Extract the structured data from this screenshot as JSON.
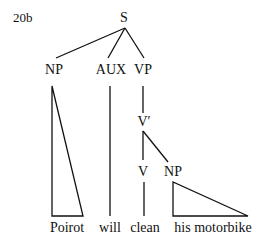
{
  "example_number": "20b",
  "tree": {
    "root": "S",
    "nodes": {
      "s": "S",
      "np_subject": "NP",
      "aux": "AUX",
      "vp": "VP",
      "v_bar": "V′",
      "v": "V",
      "np_object": "NP"
    },
    "leaves": {
      "subject": "Poirot",
      "aux": "will",
      "verb": "clean",
      "object": "his motorbike"
    },
    "structure": "[S [NP Poirot] [AUX will] [VP [V' [V clean] [NP his motorbike]]]]"
  }
}
